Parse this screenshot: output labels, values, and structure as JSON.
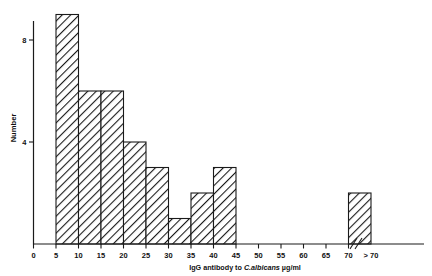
{
  "chart_data": {
    "type": "bar",
    "title": "",
    "xlabel": "IgG antibody to C.albicans µg/ml",
    "xlabel_parts": {
      "before": "IgG antibody to ",
      "italic": "C.albicans",
      "after": "µg/ml"
    },
    "ylabel": "Number",
    "categories": [
      "5-10",
      "10-15",
      "15-20",
      "20-25",
      "25-30",
      "30-35",
      "35-40",
      "40-45",
      ">70"
    ],
    "bin_starts": [
      5,
      10,
      15,
      20,
      25,
      30,
      35,
      40,
      70
    ],
    "bin_ends": [
      10,
      15,
      20,
      25,
      30,
      35,
      40,
      45,
      75
    ],
    "values": [
      9,
      6,
      6,
      4,
      3,
      1,
      2,
      3,
      2
    ],
    "xtick_labels": [
      "0",
      "5",
      "10",
      "15",
      "20",
      "25",
      "30",
      "35",
      "40",
      "45",
      "50",
      "55",
      "60",
      "65",
      "70",
      "> 70"
    ],
    "xtick_values": [
      0,
      5,
      10,
      15,
      20,
      25,
      30,
      35,
      40,
      45,
      50,
      55,
      60,
      65,
      70,
      75
    ],
    "ytick_labels": [
      "4",
      "8"
    ],
    "ytick_values": [
      4,
      8
    ],
    "ylim": [
      0,
      8.6
    ],
    "xlim": [
      0,
      78
    ],
    "grid": false,
    "legend": null,
    "axis_break": {
      "present": true,
      "symbol": "//",
      "after_value": 70,
      "label_for_last_bin": "> 70"
    },
    "bar_fill": "hatched-diagonal",
    "bar_stroke_color": "#1a1a1a",
    "background_color": "#ffffff"
  }
}
